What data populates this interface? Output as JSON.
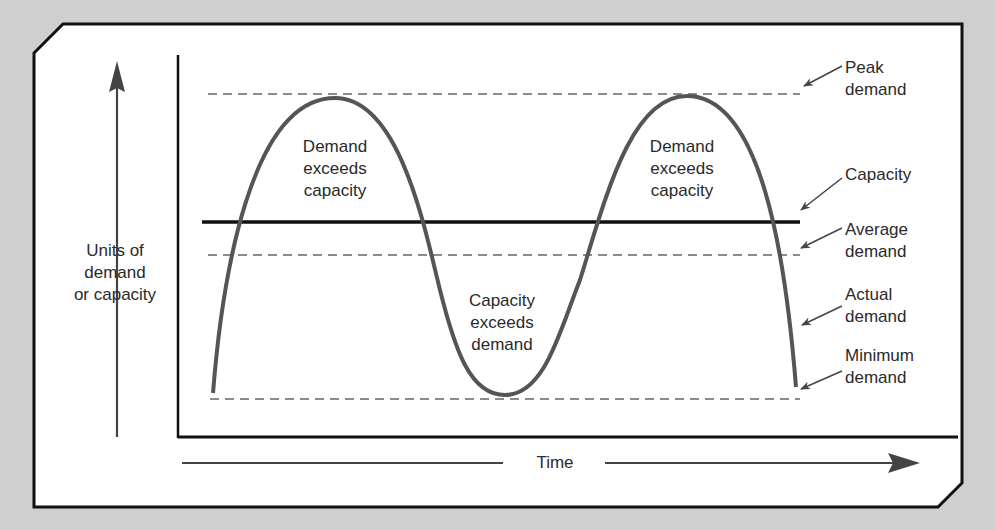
{
  "diagram": {
    "type": "demand-vs-capacity",
    "y_axis_label": [
      "Units of",
      "demand",
      "or capacity"
    ],
    "x_axis_label": "Time",
    "regions": [
      {
        "name": "demand-exceeds-capacity-1",
        "lines": [
          "Demand",
          "exceeds",
          "capacity"
        ]
      },
      {
        "name": "capacity-exceeds-demand",
        "lines": [
          "Capacity",
          "exceeds",
          "demand"
        ]
      },
      {
        "name": "demand-exceeds-capacity-2",
        "lines": [
          "Demand",
          "exceeds",
          "capacity"
        ]
      }
    ],
    "callouts": {
      "peak": [
        "Peak",
        "demand"
      ],
      "capacity": [
        "Capacity"
      ],
      "average": [
        "Average",
        "demand"
      ],
      "actual": [
        "Actual",
        "demand"
      ],
      "minimum": [
        "Minimum",
        "demand"
      ]
    },
    "colors": {
      "background": "#cfcfcf",
      "panel": "#ffffff",
      "frame": "#111111",
      "curve": "#555555",
      "dashed": "#666666",
      "text": "#2a2a2a"
    }
  }
}
